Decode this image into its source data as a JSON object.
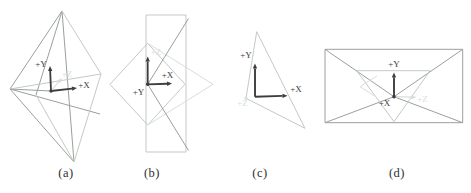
{
  "figure": {
    "background": "#ffffff",
    "colors": {
      "dark": "#3d3d3d",
      "medium": "#9aa09b",
      "light": "#c3cac4",
      "faint": "#d9ded9",
      "caption": "#2e2e2e"
    },
    "panels": [
      {
        "id": "a",
        "caption": "(a)",
        "lines": [
          [
            62,
            11,
            10,
            89,
            "medium"
          ],
          [
            62,
            11,
            74,
            162,
            "medium"
          ],
          [
            10,
            89,
            74,
            162,
            "medium"
          ],
          [
            10,
            89,
            100,
            114,
            "medium"
          ],
          [
            10,
            89,
            51,
            91,
            "medium"
          ],
          [
            62,
            11,
            36,
            95,
            "medium"
          ],
          [
            62,
            11,
            101,
            74,
            "light"
          ],
          [
            101,
            74,
            74,
            162,
            "light"
          ],
          [
            10,
            89,
            101,
            74,
            "light"
          ],
          [
            36,
            95,
            74,
            162,
            "light"
          ]
        ],
        "arrows": [
          [
            51,
            91,
            50,
            66,
            "dark",
            1.8
          ],
          [
            51,
            91,
            77,
            88,
            "dark",
            1.8
          ],
          [
            51,
            91,
            62,
            78,
            "faint",
            1.1
          ]
        ],
        "dots": [
          [
            51,
            91,
            1.7,
            "dark"
          ]
        ],
        "labels": [
          {
            "t": "+Y",
            "x": 41,
            "y": 67,
            "c": "dark"
          },
          {
            "t": "+X",
            "x": 84,
            "y": 88,
            "c": "dark"
          },
          {
            "t": "+Z",
            "x": 67,
            "y": 77,
            "c": "faint"
          }
        ]
      },
      {
        "id": "b",
        "caption": "(b)",
        "lines": [
          [
            146,
            15,
            186,
            15,
            "light"
          ],
          [
            186,
            15,
            186,
            152,
            "light"
          ],
          [
            146,
            152,
            186,
            152,
            "light"
          ],
          [
            146,
            15,
            146,
            152,
            "light"
          ],
          [
            147.7,
            43.3,
            185,
            84.3,
            "light"
          ],
          [
            185,
            84.3,
            147.7,
            125,
            "light"
          ],
          [
            147.7,
            125,
            110,
            84.3,
            "light"
          ],
          [
            110,
            84.3,
            147.7,
            43.3,
            "light"
          ],
          [
            147.7,
            43.3,
            213,
            84.3,
            "faint"
          ],
          [
            147.7,
            125,
            213,
            84.3,
            "faint"
          ],
          [
            188.5,
            18.5,
            147.7,
            84.3,
            "medium"
          ],
          [
            147.7,
            84.3,
            188.5,
            150.5,
            "medium"
          ]
        ],
        "arrows": [
          [
            147.7,
            84.3,
            172,
            83.6,
            "dark",
            1.8
          ],
          [
            147.7,
            84.3,
            147.7,
            56.5,
            "dark",
            1.8
          ]
        ],
        "dots": [
          [
            147.7,
            84.3,
            1.8,
            "dark"
          ]
        ],
        "labels": [
          {
            "t": "+X",
            "x": 167.5,
            "y": 77.5,
            "c": "dark"
          },
          {
            "t": "+Y",
            "x": 138.5,
            "y": 95,
            "c": "dark"
          },
          {
            "t": "+Z",
            "x": 156,
            "y": 55,
            "c": "faint"
          }
        ]
      },
      {
        "id": "c",
        "caption": "(c)",
        "lines": [
          [
            256.7,
            31.7,
            246,
            98.3,
            "light"
          ],
          [
            256.7,
            31.7,
            305,
            128.3,
            "light"
          ],
          [
            246,
            98.3,
            305,
            128.3,
            "light"
          ]
        ],
        "arrows": [
          [
            255,
            96.7,
            255,
            63.5,
            "dark",
            1.9
          ],
          [
            255,
            96.7,
            287.5,
            95.7,
            "dark",
            1.9
          ]
        ],
        "dots": [
          [
            246,
            98.3,
            1.6,
            "faint"
          ]
        ],
        "labels": [
          {
            "t": "+Y",
            "x": 246,
            "y": 57.5,
            "c": "dark"
          },
          {
            "t": "+X",
            "x": 296,
            "y": 91.5,
            "c": "dark"
          },
          {
            "t": "+Z",
            "x": 242.5,
            "y": 106,
            "c": "faint"
          }
        ]
      },
      {
        "id": "d",
        "caption": "(d)",
        "lines": [
          [
            325,
            49.3,
            462.7,
            49.3,
            "medium"
          ],
          [
            462.7,
            49.3,
            462.7,
            122.7,
            "medium"
          ],
          [
            325,
            122.7,
            462.7,
            122.7,
            "medium"
          ],
          [
            325,
            49.3,
            325,
            122.7,
            "medium"
          ],
          [
            325,
            49.3,
            394,
            96.7,
            "medium"
          ],
          [
            462.7,
            49.3,
            394,
            96.7,
            "medium"
          ],
          [
            325,
            122.7,
            394,
            96.7,
            "medium"
          ],
          [
            462.7,
            122.7,
            394,
            96.7,
            "medium"
          ],
          [
            356.7,
            70.7,
            430,
            70.7,
            "light"
          ],
          [
            356.7,
            70.7,
            394,
            121.7,
            "light"
          ],
          [
            430,
            70.7,
            394,
            121.7,
            "light"
          ],
          [
            360,
            86.7,
            377,
            76,
            "faint"
          ],
          [
            360,
            86.7,
            377,
            97.5,
            "faint"
          ]
        ],
        "arrows": [
          [
            394,
            96.7,
            394,
            72.5,
            "dark",
            1.9
          ],
          [
            394,
            96.7,
            416.5,
            97.3,
            "faint",
            1.2
          ]
        ],
        "dots": [
          [
            394,
            96.7,
            1.8,
            "dark"
          ]
        ],
        "labels": [
          {
            "t": "+Y",
            "x": 394,
            "y": 66.5,
            "c": "dark"
          },
          {
            "t": "+X",
            "x": 384.5,
            "y": 106,
            "c": "dark"
          },
          {
            "t": "+Z",
            "x": 422.5,
            "y": 101.5,
            "c": "faint"
          }
        ]
      }
    ]
  }
}
